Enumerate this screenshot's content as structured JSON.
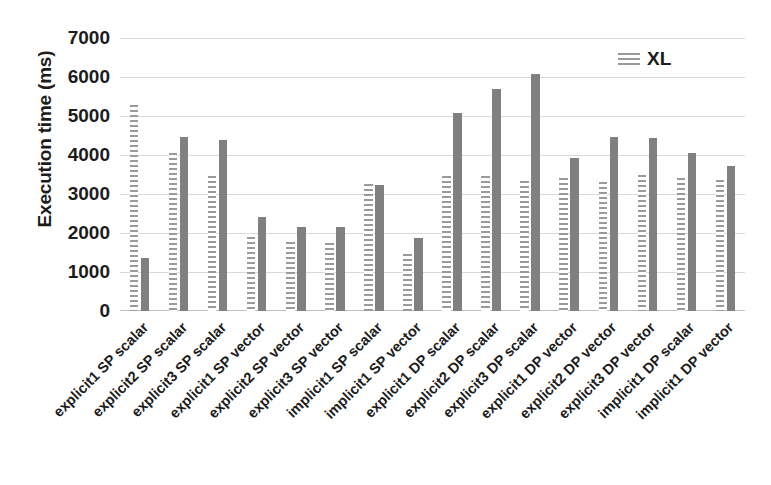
{
  "chart_data": {
    "type": "bar",
    "title": "",
    "xlabel": "",
    "ylabel": "Execution time (ms)",
    "ylim": [
      0,
      7000
    ],
    "ytick_step": 1000,
    "yticks": [
      "7000",
      "6000",
      "5000",
      "4000",
      "3000",
      "2000",
      "1000",
      "0"
    ],
    "grid": true,
    "legend_position": "top-right",
    "categories": [
      "explicit1 SP scalar",
      "explicit2 SP scalar",
      "explicit3 SP scalar",
      "explicit1 SP vector",
      "explicit2 SP vector",
      "explicit3 SP vector",
      "implicit1 SP scalar",
      "implicit1 SP vector",
      "explicit1 DP scalar",
      "explicit2 DP scalar",
      "explicit3 DP scalar",
      "explicit1 DP vector",
      "explicit2 DP vector",
      "explicit3 DP vector",
      "implicit1 DP scalar",
      "implicit1 DP vector"
    ],
    "series": [
      {
        "name": "XL",
        "pattern": "horizontal-hatch",
        "color": "#9a9a9a",
        "values": [
          5280,
          4050,
          3450,
          1900,
          1780,
          1750,
          3250,
          1450,
          3450,
          3450,
          3330,
          3400,
          3300,
          3500,
          3400,
          3350
        ]
      },
      {
        "name": "",
        "pattern": "solid",
        "color": "#808080",
        "values": [
          1360,
          4450,
          4380,
          2420,
          2150,
          2160,
          3240,
          1870,
          5080,
          5700,
          6080,
          3930,
          4450,
          4430,
          4060,
          3720
        ]
      }
    ]
  },
  "legend": {
    "entries": [
      {
        "label": "XL"
      }
    ]
  },
  "colors": {
    "bar_solid": "#808080",
    "bar_hatch": "#9a9a9a",
    "gridline": "#d9d9d9",
    "text": "#1c1c1c",
    "background": "#ffffff"
  }
}
